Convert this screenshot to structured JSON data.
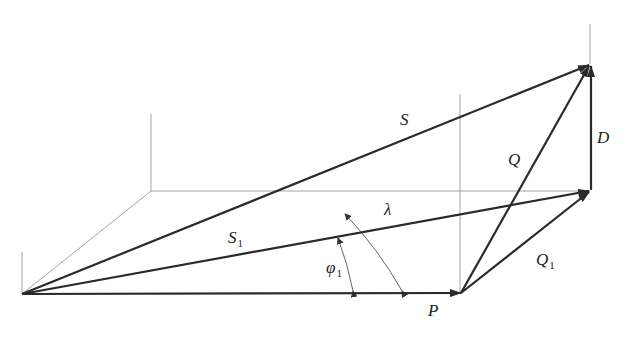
{
  "diagram": {
    "type": "vector-diagram",
    "labels": {
      "S": "S",
      "S1_main": "S",
      "S1_sub": "1",
      "Q": "Q",
      "Q1_main": "Q",
      "Q1_sub": "1",
      "D": "D",
      "P": "P",
      "lambda": "λ",
      "phi1_main": "φ",
      "phi1_sub": "1"
    },
    "points": {
      "origin": [
        22,
        294
      ],
      "P_tip": [
        461,
        293
      ],
      "S_tip": [
        590,
        64
      ],
      "S1_tip": [
        590,
        190
      ]
    },
    "vectors": [
      {
        "name": "P",
        "from": "origin",
        "to": "P_tip"
      },
      {
        "name": "S",
        "from": "origin",
        "to": "S_tip"
      },
      {
        "name": "S1",
        "from": "origin",
        "to": "S1_tip"
      },
      {
        "name": "Q",
        "from": "P_tip",
        "to": "S_tip"
      },
      {
        "name": "Q1",
        "from": "P_tip",
        "to": "S1_tip"
      },
      {
        "name": "D",
        "from": "S1_tip",
        "to": "S_tip"
      }
    ],
    "angles": [
      {
        "name": "phi1",
        "between": [
          "P",
          "S1"
        ]
      },
      {
        "name": "lambda",
        "between": [
          "P",
          "S"
        ]
      }
    ],
    "colors": {
      "vector": "#2a2a2a",
      "guide": "#9a9a9a",
      "background": "#ffffff"
    }
  }
}
